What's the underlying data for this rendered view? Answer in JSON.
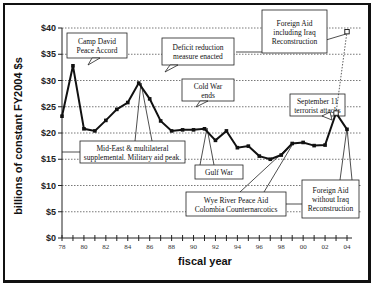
{
  "chart_data": {
    "type": "line",
    "title": "",
    "xlabel": "fiscal year",
    "ylabel": "billions of constant FY2004 $s",
    "ylim": [
      0,
      40
    ],
    "xlim": [
      1978,
      2004
    ],
    "grid": "horizontal dotted",
    "y_ticks": [
      "$0",
      "$5",
      "$10",
      "$15",
      "$20",
      "$25",
      "$30",
      "$35",
      "$40"
    ],
    "y_tick_values": [
      0,
      5,
      10,
      15,
      20,
      25,
      30,
      35,
      40
    ],
    "x_ticks": [
      "78",
      "80",
      "82",
      "84",
      "86",
      "88",
      "90",
      "92",
      "94",
      "96",
      "98",
      "00",
      "02",
      "04"
    ],
    "x_tick_values": [
      1978,
      1980,
      1982,
      1984,
      1986,
      1988,
      1990,
      1992,
      1994,
      1996,
      1998,
      2000,
      2002,
      2004
    ],
    "series": [
      {
        "name": "Foreign Aid without Iraq Reconstruction",
        "x": [
          1978,
          1979,
          1980,
          1981,
          1982,
          1983,
          1984,
          1985,
          1986,
          1987,
          1988,
          1989,
          1990,
          1991,
          1992,
          1993,
          1994,
          1995,
          1996,
          1997,
          1998,
          1999,
          2000,
          2001,
          2002,
          2003,
          2004
        ],
        "values": [
          23.2,
          32.8,
          20.8,
          20.4,
          22.4,
          24.5,
          25.8,
          29.5,
          26.5,
          22.3,
          20.4,
          20.6,
          20.6,
          20.8,
          18.6,
          20.4,
          17.2,
          17.5,
          15.6,
          15.0,
          15.8,
          18.0,
          18.2,
          17.6,
          17.7,
          23.8,
          20.7
        ]
      },
      {
        "name": "Foreign Aid including Iraq Reconstruction",
        "x": [
          2002,
          2003,
          2004
        ],
        "values": [
          17.7,
          23.8,
          39.3
        ]
      }
    ],
    "annotations": [
      {
        "text": [
          "Camp David",
          "Peace Accord"
        ],
        "year": 1979
      },
      {
        "text": [
          "Deficit reduction",
          "measure enacted"
        ],
        "year": 1986
      },
      {
        "text": [
          "Foreign Aid",
          "including Iraq",
          "Reconstruction"
        ],
        "year": 2004
      },
      {
        "text": [
          "Cold War",
          "ends"
        ],
        "year": 1990
      },
      {
        "text": [
          "September 11",
          "terrorist attacks"
        ],
        "year": 2002
      },
      {
        "text": [
          "Mid-East & multilateral",
          "supplemental. Military aid peak."
        ],
        "year": 1985
      },
      {
        "text": [
          "Gulf War"
        ],
        "year": 1991
      },
      {
        "text": [
          "Wye River Peace Aid",
          "Colombia Counternarcotics"
        ],
        "year": 1999
      },
      {
        "text": [
          "Foreign Aid",
          "without Iraq",
          "Reconstruction"
        ],
        "year": 2004
      }
    ]
  }
}
